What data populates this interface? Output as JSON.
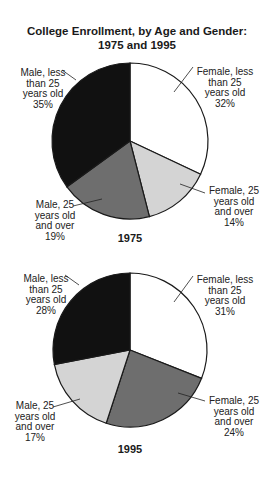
{
  "chart_data": [
    {
      "type": "pie",
      "title": "College Enrollment, by Age and Gender: 1975 and 1995",
      "caption": "1975",
      "start_angle": "12 o'clock, clockwise",
      "slices": [
        {
          "label": "Female, less than 25 years old",
          "value": 32,
          "color": "#ffffff"
        },
        {
          "label": "Female, 25 years old and over",
          "value": 14,
          "color": "#d4d4d4"
        },
        {
          "label": "Male, 25 years old and over",
          "value": 19,
          "color": "#6e6e6e"
        },
        {
          "label": "Male, less than 25 years old",
          "value": 35,
          "color": "#111111"
        }
      ]
    },
    {
      "type": "pie",
      "title": "College Enrollment, by Age and Gender: 1975 and 1995",
      "caption": "1995",
      "start_angle": "12 o'clock, clockwise",
      "slices": [
        {
          "label": "Female, less than 25 years old",
          "value": 31,
          "color": "#ffffff"
        },
        {
          "label": "Female, 25 years old and over",
          "value": 24,
          "color": "#6e6e6e"
        },
        {
          "label": "Male, 25 years old and over",
          "value": 17,
          "color": "#d4d4d4"
        },
        {
          "label": "Male, less than 25 years old",
          "value": 28,
          "color": "#111111"
        }
      ]
    }
  ],
  "title_line1": "College Enrollment, by Age and Gender:",
  "title_line2": "1975 and 1995",
  "pie1": {
    "year": "1975",
    "labels": {
      "male_young": [
        "Male, less",
        "than 25",
        "years old",
        "35%"
      ],
      "female_young": [
        "Female, less",
        "than 25",
        "years old",
        "32%"
      ],
      "female_old": [
        "Female, 25",
        "years old",
        "and over",
        "14%"
      ],
      "male_old": [
        "Male, 25",
        "years old",
        "and over",
        "19%"
      ]
    }
  },
  "pie2": {
    "year": "1995",
    "labels": {
      "male_young": [
        "Male, less",
        "than 25",
        "years old",
        "28%"
      ],
      "female_young": [
        "Female, less",
        "than 25",
        "years old",
        "31%"
      ],
      "female_old": [
        "Female, 25",
        "years old",
        "and over",
        "24%"
      ],
      "male_old": [
        "Male, 25",
        "years old",
        "and over",
        "17%"
      ]
    }
  }
}
